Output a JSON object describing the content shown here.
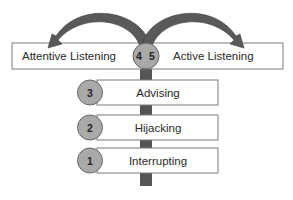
{
  "diagram": {
    "top_row": {
      "left_label": "Attentive Listening",
      "right_label": "Active Listening",
      "center_numbers": [
        "4",
        "5"
      ]
    },
    "levels": [
      {
        "number": "3",
        "label": "Advising"
      },
      {
        "number": "2",
        "label": "Hijacking"
      },
      {
        "number": "1",
        "label": "Interrupting"
      }
    ],
    "arrows": [
      {
        "direction": "left",
        "target": "Attentive Listening"
      },
      {
        "direction": "right",
        "target": "Active Listening"
      }
    ],
    "colors": {
      "stem": "#555555",
      "arrow": "#595959",
      "circle_fill": "#a9a9a9",
      "circle_stroke": "#666666",
      "box_stroke": "#7a7a7a",
      "box_fill": "#ffffff"
    }
  }
}
